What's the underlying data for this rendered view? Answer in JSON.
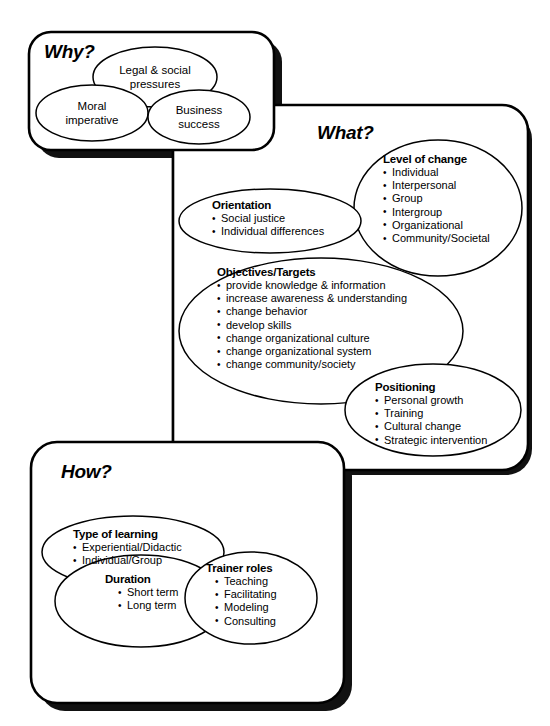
{
  "diagram": {
    "line_color": "#000000",
    "shadow_color": "#1a1a1a",
    "background_color": "#ffffff"
  },
  "panels": [
    {
      "id": "why",
      "title": "Why?",
      "groups": [
        {
          "id": "legal-social-pressures",
          "label": "Legal & social\npressures",
          "label_line1": "Legal & social",
          "label_line2": "pressures",
          "items": []
        },
        {
          "id": "moral-imperative",
          "label": "Moral\nimperative",
          "label_line1": "Moral",
          "label_line2": "imperative",
          "items": []
        },
        {
          "id": "business-success",
          "label": "Business\nsuccess",
          "label_line1": "Business",
          "label_line2": "success",
          "items": []
        }
      ]
    },
    {
      "id": "what",
      "title": "What?",
      "groups": [
        {
          "id": "level-of-change",
          "label": "Level of change",
          "items": [
            "Individual",
            "Interpersonal",
            "Group",
            "Intergroup",
            "Organizational",
            "Community/Societal"
          ]
        },
        {
          "id": "orientation",
          "label": "Orientation",
          "items": [
            "Social justice",
            "Individual differences"
          ]
        },
        {
          "id": "objectives-targets",
          "label": "Objectives/Targets",
          "items": [
            "provide knowledge & information",
            "increase awareness & understanding",
            "change behavior",
            "develop skills",
            "change organizational culture",
            "change organizational system",
            "change community/society"
          ]
        },
        {
          "id": "positioning",
          "label": "Positioning",
          "items": [
            "Personal growth",
            "Training",
            "Cultural change",
            "Strategic intervention"
          ]
        }
      ]
    },
    {
      "id": "how",
      "title": "How?",
      "groups": [
        {
          "id": "type-of-learning",
          "label": "Type of learning",
          "items": [
            "Experiential/Didactic",
            "Individual/Group"
          ]
        },
        {
          "id": "duration",
          "label": "Duration",
          "items": [
            "Short term",
            "Long term"
          ]
        },
        {
          "id": "trainer-roles",
          "label": "Trainer roles",
          "items": [
            "Teaching",
            "Facilitating",
            "Modeling",
            "Consulting"
          ]
        }
      ]
    }
  ]
}
